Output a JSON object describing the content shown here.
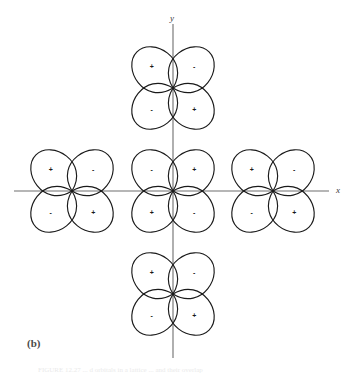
{
  "figure": {
    "panel_label": "(b)",
    "caption_fragment": "FIGURE 12.27  ...  d orbitals in a lattice ...  and their overlap",
    "axis_x_label": "x",
    "axis_y_label": "y",
    "stroke_color": "#1a1a1a",
    "axis_color": "#6e6e6e",
    "background_color": "#ffffff"
  },
  "geometry": {
    "origin_x": 173,
    "origin_y": 191,
    "spacing_x": 100,
    "spacing_y": 103,
    "lobe_length": 50,
    "lobe_width": 36
  },
  "chart_data": {
    "type": "diagram",
    "title": "",
    "clusters": [
      {
        "name": "top-cluster",
        "cx": 173,
        "cy": 88,
        "signs": {
          "upper_left": "+",
          "upper_right": "-",
          "lower_left": "-",
          "lower_right": "+"
        }
      },
      {
        "name": "left-cluster",
        "cx": 72,
        "cy": 191,
        "signs": {
          "upper_left": "+",
          "upper_right": "-",
          "lower_left": "-",
          "lower_right": "+"
        }
      },
      {
        "name": "center-cluster",
        "cx": 173,
        "cy": 191,
        "signs": {
          "upper_left": "-",
          "upper_right": "+",
          "lower_left": "+",
          "lower_right": "-"
        }
      },
      {
        "name": "right-cluster",
        "cx": 273,
        "cy": 191,
        "signs": {
          "upper_left": "+",
          "upper_right": "-",
          "lower_left": "-",
          "lower_right": "+"
        }
      },
      {
        "name": "bottom-cluster",
        "cx": 173,
        "cy": 294,
        "signs": {
          "upper_left": "+",
          "upper_right": "-",
          "lower_left": "-",
          "lower_right": "+"
        }
      }
    ],
    "axes": {
      "x": {
        "label": "x",
        "x1": 14,
        "y1": 191,
        "x2": 329,
        "y2": 191
      },
      "y": {
        "label": "y",
        "x1": 173,
        "y1": 24,
        "x2": 173,
        "y2": 358
      }
    }
  }
}
